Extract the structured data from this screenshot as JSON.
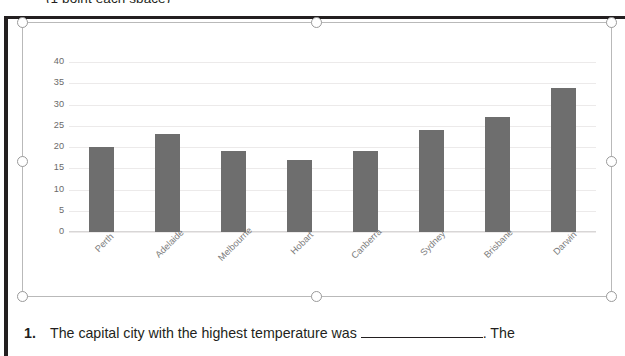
{
  "document": {
    "clipped_heading": "(1 point each space)",
    "question": {
      "number": "1.",
      "text_before_blank": "The capital city with the highest temperature was",
      "blank": "",
      "text_after_blank": ". The"
    }
  },
  "chart_object": {
    "selected": true,
    "handles": [
      "top-left",
      "top-center",
      "top-right",
      "middle-left",
      "middle-right",
      "bottom-left",
      "bottom-center",
      "bottom-right"
    ]
  },
  "chart_data": {
    "type": "bar",
    "title": "",
    "xlabel": "",
    "ylabel": "",
    "categories": [
      "Perth",
      "Adelaide",
      "Melbourne",
      "Hobart",
      "Canberra",
      "Sydney",
      "Brisbane",
      "Darwin"
    ],
    "values": [
      20,
      23,
      19,
      17,
      19,
      24,
      27,
      34
    ],
    "ylim": [
      0,
      40
    ],
    "yticks": [
      0,
      5,
      10,
      15,
      20,
      25,
      30,
      35,
      40
    ],
    "ytick_labels": [
      "0",
      "5",
      "10",
      "15",
      "20",
      "25",
      "30",
      "35",
      "40"
    ],
    "grid": true,
    "legend": false,
    "bar_color": "#6e6e6e",
    "gridline_color": "#eceaea",
    "tick_label_color": "#6a6a6a",
    "category_label_color": "#7d7d7d",
    "category_label_rotation": -45
  }
}
